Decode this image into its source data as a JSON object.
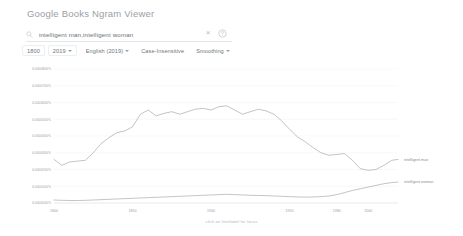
{
  "header": {
    "title": "Google Books Ngram Viewer",
    "title_prefix": "Go",
    "title_rest": "ogle Books Ngram Viewer"
  },
  "search": {
    "icon": "search-icon",
    "value": "intelligent man,intelligent woman",
    "placeholder": "",
    "clear_icon": "close-icon",
    "clear_glyph": "×",
    "help_icon": "help-circle-icon"
  },
  "options": {
    "year_start": "1800",
    "year_end": "2019",
    "corpus": "English (2019)",
    "case": "Case-Insensitive",
    "smoothing": "Smoothing"
  },
  "footer": {
    "hint": "click on line/label for focus"
  },
  "chart_data": {
    "type": "line",
    "title": "",
    "xlabel": "",
    "ylabel": "",
    "grid": true,
    "legend_position": "right",
    "xlim": [
      1800,
      2019
    ],
    "ylim": [
      0.0,
      8e-05
    ],
    "xticks": [
      1800,
      1850,
      1900,
      1950,
      1980,
      2000
    ],
    "xticklabels": [
      "1800",
      "1850",
      "1900",
      "1950",
      "1980",
      "2000"
    ],
    "yticks": [
      0.0,
      1e-05,
      2e-05,
      3e-05,
      4e-05,
      5e-05,
      6e-05,
      7e-05,
      8e-05
    ],
    "yticklabels": [
      "0.0000000%",
      "0.0000100%",
      "0.0000200%",
      "0.0000300%",
      "0.0000400%",
      "0.0000500%",
      "0.0000600%",
      "0.0000700%",
      "0.0000800%"
    ],
    "series": [
      {
        "name": "intelligent man",
        "color": "#9a9fa5",
        "x": [
          1800,
          1805,
          1810,
          1815,
          1820,
          1825,
          1830,
          1835,
          1840,
          1845,
          1850,
          1855,
          1860,
          1865,
          1870,
          1875,
          1880,
          1885,
          1890,
          1895,
          1900,
          1905,
          1910,
          1915,
          1920,
          1925,
          1930,
          1935,
          1940,
          1945,
          1950,
          1955,
          1960,
          1965,
          1970,
          1975,
          1980,
          1985,
          1990,
          1995,
          2000,
          2005,
          2010,
          2015,
          2019
        ],
        "values": [
          2.6e-05,
          2.25e-05,
          2.45e-05,
          2.5e-05,
          2.55e-05,
          3e-05,
          3.55e-05,
          3.9e-05,
          4.2e-05,
          4.3e-05,
          4.55e-05,
          5.3e-05,
          5.55e-05,
          5.2e-05,
          5.35e-05,
          5.45e-05,
          5.3e-05,
          5.45e-05,
          5.6e-05,
          5.65e-05,
          5.55e-05,
          5.75e-05,
          5.8e-05,
          5.55e-05,
          5.3e-05,
          5.45e-05,
          5.6e-05,
          5.5e-05,
          5.3e-05,
          4.9e-05,
          4.4e-05,
          3.95e-05,
          3.65e-05,
          3.3e-05,
          3e-05,
          2.85e-05,
          2.9e-05,
          2.95e-05,
          2.55e-05,
          2.05e-05,
          1.95e-05,
          2e-05,
          2.25e-05,
          2.55e-05,
          2.6e-05
        ]
      },
      {
        "name": "intelligent woman",
        "color": "#9a9fa5",
        "x": [
          1800,
          1805,
          1810,
          1815,
          1820,
          1825,
          1830,
          1835,
          1840,
          1845,
          1850,
          1855,
          1860,
          1865,
          1870,
          1875,
          1880,
          1885,
          1890,
          1895,
          1900,
          1905,
          1910,
          1915,
          1920,
          1925,
          1930,
          1935,
          1940,
          1945,
          1950,
          1955,
          1960,
          1965,
          1970,
          1975,
          1980,
          1985,
          1990,
          1995,
          2000,
          2005,
          2010,
          2015,
          2019
        ],
        "values": [
          1.8e-06,
          1.6e-06,
          1.5e-06,
          1.5e-06,
          1.6e-06,
          1.8e-06,
          2e-06,
          2.2e-06,
          2.4e-06,
          2.6e-06,
          2.8e-06,
          3e-06,
          3.2e-06,
          3.4e-06,
          3.6e-06,
          3.8e-06,
          4e-06,
          4.2e-06,
          4.4e-06,
          4.6e-06,
          4.8e-06,
          5e-06,
          5.2e-06,
          5e-06,
          4.8e-06,
          4.6e-06,
          4.5e-06,
          4.4e-06,
          4.2e-06,
          4e-06,
          3.8e-06,
          3.6e-06,
          3.5e-06,
          3.6e-06,
          3.8e-06,
          4.2e-06,
          5e-06,
          6.2e-06,
          7.5e-06,
          8.5e-06,
          9.5e-06,
          1.05e-05,
          1.15e-05,
          1.22e-05,
          1.25e-05
        ]
      }
    ]
  }
}
